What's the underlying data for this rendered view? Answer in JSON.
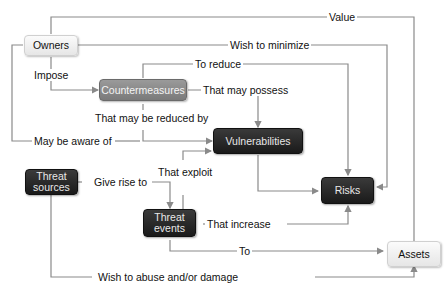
{
  "diagram": {
    "nodes": {
      "owners": "Owners",
      "countermeasures": "Countermeasures",
      "vulnerabilities": "Vulnerabilities",
      "threat_sources_line1": "Threat",
      "threat_sources_line2": "sources",
      "threat_events_line1": "Threat",
      "threat_events_line2": "events",
      "risks": "Risks",
      "assets": "Assets"
    },
    "edges": {
      "value": "Value",
      "wish_to_minimize": "Wish to minimize",
      "to_reduce": "To reduce",
      "impose": "Impose",
      "that_may_possess": "That may possess",
      "that_may_be_reduced_by": "That may be reduced by",
      "may_be_aware_of": "May be aware of",
      "give_rise_to": "Give rise to",
      "that_exploit": "That exploit",
      "that_increase": "That increase",
      "to": "To",
      "wish_to_abuse": "Wish to abuse and/or damage"
    },
    "colors": {
      "line": "#8a8a8a",
      "dark_node": "#222222",
      "mid_node": "#888888",
      "light_node": "#eeeeee"
    }
  }
}
